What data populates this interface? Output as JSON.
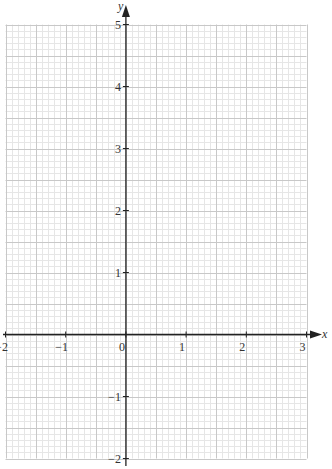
{
  "chart_data": {
    "type": "scatter",
    "title": "",
    "xlabel": "x",
    "ylabel": "y",
    "xlim": [
      -2,
      3
    ],
    "ylim": [
      -2,
      5
    ],
    "x_ticks": [
      -2,
      -1,
      0,
      1,
      2,
      3
    ],
    "y_ticks": [
      -2,
      -1,
      1,
      2,
      3,
      4,
      5
    ],
    "x_tick_labels": [
      "−2",
      "−1",
      "0",
      "1",
      "2",
      "3"
    ],
    "y_tick_labels": [
      "−2",
      "−1",
      "1",
      "2",
      "3",
      "4",
      "5"
    ],
    "grid": true,
    "grid_minor_step": 0.1,
    "grid_major_step": 0.5,
    "series": [],
    "legend": null
  },
  "colors": {
    "axis": "#222222",
    "grid_minor": "#e6e6e6",
    "grid_major": "#c8c8c8",
    "text": "#333333"
  }
}
